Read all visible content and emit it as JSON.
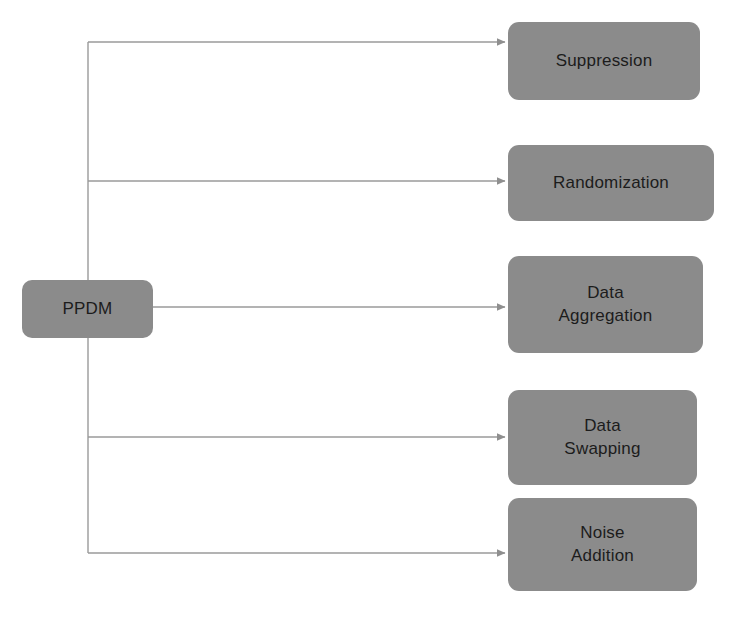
{
  "diagram": {
    "type": "flow-tree",
    "orientation": "left-to-right",
    "colors": {
      "node_fill": "#8b8b8b",
      "node_text": "#1c1c1c",
      "connector": "#8f8f8f",
      "background": "#ffffff"
    },
    "root": {
      "label": "PPDM",
      "x": 22,
      "y": 280,
      "width": 131,
      "height": 58
    },
    "branches": [
      {
        "label": "Suppression",
        "x": 508,
        "y": 22,
        "width": 192,
        "height": 78,
        "arrow_y": 42
      },
      {
        "label": "Randomization",
        "x": 508,
        "y": 145,
        "width": 206,
        "height": 76,
        "arrow_y": 181
      },
      {
        "label": "Data\nAggregation",
        "x": 508,
        "y": 256,
        "width": 195,
        "height": 97,
        "arrow_y": 307
      },
      {
        "label": "Data\nSwapping",
        "x": 508,
        "y": 390,
        "width": 189,
        "height": 95,
        "arrow_y": 437
      },
      {
        "label": "Noise\nAddition",
        "x": 508,
        "y": 498,
        "width": 189,
        "height": 93,
        "arrow_y": 553
      }
    ],
    "trunk": {
      "x": 88,
      "top_y": 42,
      "bottom_y": 553
    }
  }
}
